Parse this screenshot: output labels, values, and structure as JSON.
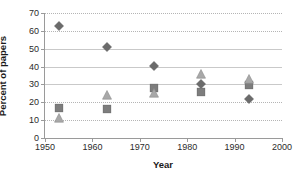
{
  "chart_data": {
    "type": "scatter",
    "title": "",
    "xlabel": "Year",
    "ylabel": "Percent of papers",
    "xlim": [
      1950,
      2000
    ],
    "ylim": [
      0,
      70
    ],
    "xticks": [
      1950,
      1960,
      1970,
      1980,
      1990,
      2000
    ],
    "yticks": [
      0,
      10,
      20,
      30,
      40,
      50,
      60,
      70
    ],
    "grid": true,
    "legend": "none",
    "x": [
      1953,
      1963,
      1973,
      1983,
      1993
    ],
    "series": [
      {
        "name": "diamond-series",
        "marker": "diamond",
        "color": "#6b6b6b",
        "values": [
          63,
          51,
          40.3,
          30.5,
          22
        ]
      },
      {
        "name": "square-series",
        "marker": "square",
        "color": "#7d7d7d",
        "values": [
          17,
          16,
          27.8,
          26,
          29.5
        ]
      },
      {
        "name": "triangle-series",
        "marker": "triangle",
        "color": "#a8a8a8",
        "values": [
          11,
          24,
          25.3,
          36,
          33
        ]
      }
    ]
  },
  "axes": {
    "y_title": "Percent of papers",
    "x_title": "Year",
    "y_tick_labels": [
      "0",
      "10",
      "20",
      "30",
      "40",
      "50",
      "60",
      "70"
    ],
    "x_tick_labels": [
      "1950",
      "1960",
      "1970",
      "1980",
      "1990",
      "2000"
    ]
  },
  "colors": {
    "axis": "#9a9a9a",
    "grid_dotted": "#b5b5b5",
    "grid_solid": "#c9c9c9",
    "text": "#2b2b2b",
    "background": "#ffffff"
  }
}
